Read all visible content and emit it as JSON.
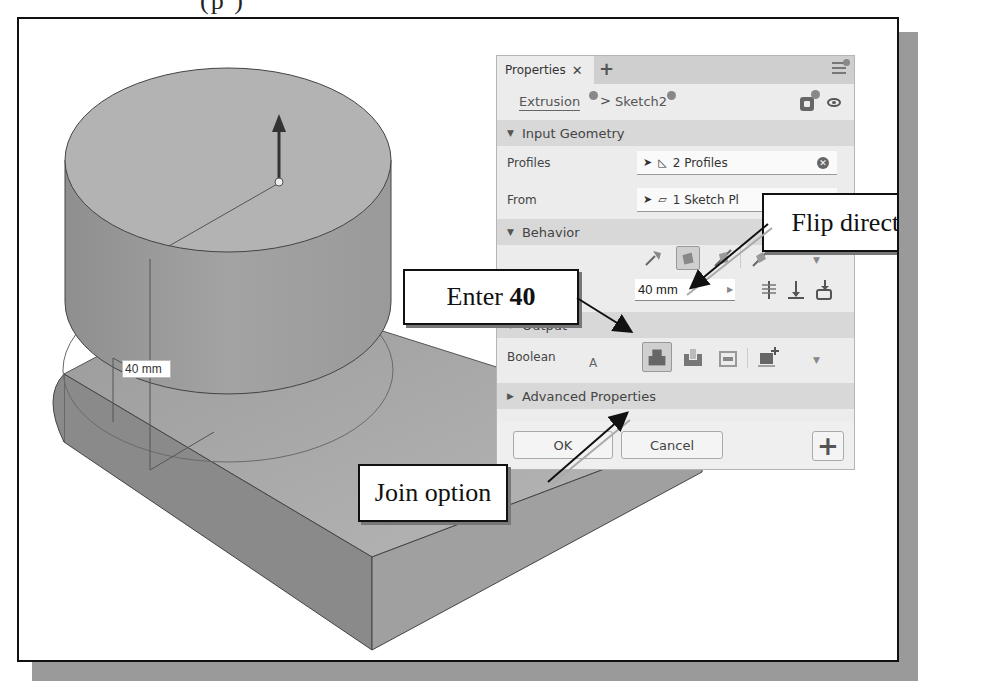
{
  "page_header_fragment": "(p   )",
  "viewport": {
    "dimension_label": "40 mm"
  },
  "properties_panel": {
    "tab_label": "Properties",
    "tab_close": "✕",
    "tab_add": "+",
    "breadcrumb": [
      {
        "label": "Extrusion"
      },
      {
        "label": "Sketch2"
      }
    ],
    "breadcrumb_separator": ">",
    "sections": {
      "input_geometry": {
        "title": "Input Geometry",
        "profiles_label": "Profiles",
        "profiles_value": "2 Profiles",
        "from_label": "From",
        "from_value": "1 Sketch Pl"
      },
      "behavior": {
        "title": "Behavior",
        "distance_label": "A",
        "distance_value": "40 mm"
      },
      "output": {
        "title": "Output",
        "boolean_label": "Boolean"
      },
      "advanced": {
        "title": "Advanced Properties"
      }
    },
    "buttons": {
      "ok": "OK",
      "cancel": "Cancel",
      "plus": "+"
    }
  },
  "callouts": {
    "flip_direction": "Flip direction",
    "enter_prefix": "Enter ",
    "enter_value": "40",
    "join_option": "Join option"
  },
  "colors": {
    "panel_bg": "#ececec",
    "section_bg": "#d8d8d8",
    "frame_shadow": "#9a9a9a"
  }
}
